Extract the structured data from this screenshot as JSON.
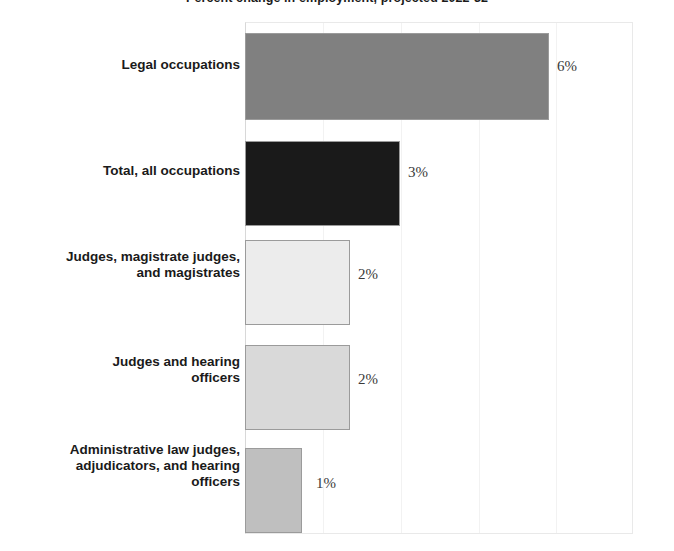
{
  "chart_data": {
    "type": "bar",
    "orientation": "horizontal",
    "title": "Percent change in employment, projected 2022-32",
    "categories": [
      "Legal occupations",
      "Total, all occupations",
      "Judges, magistrate judges,\nand magistrates",
      "Judges and hearing\nofficers",
      "Administrative law judges,\nadjudicators, and hearing\nofficers"
    ],
    "values": [
      6,
      3,
      2,
      2,
      1
    ],
    "value_labels": [
      "6%",
      "3%",
      "2%",
      "2%",
      "1%"
    ],
    "xlabel": "",
    "ylabel": "",
    "xlim": [
      0,
      7.65
    ],
    "grid": false,
    "legend": false,
    "bar_colors": [
      "#808080",
      "#1a1a1a",
      "#ececec",
      "#d9d9d9",
      "#bfbfbf"
    ],
    "bar_border_color": "#9b9b9b",
    "background_color": "#ffffff",
    "text_color": "#1a1a1a",
    "value_text_color": "#3a3a3a"
  },
  "bars": [
    {
      "label": "Legal occupations",
      "value_label": "6%",
      "color": "#808080",
      "width_px": 304,
      "top_px": 33,
      "height_px": 87,
      "value_x_px": 557,
      "value_y_px": 66,
      "label_y_px": 65
    },
    {
      "label": "Total, all occupations",
      "value_label": "3%",
      "color": "#1a1a1a",
      "width_px": 155,
      "top_px": 141,
      "height_px": 85,
      "value_x_px": 408,
      "value_y_px": 172,
      "label_y_px": 171
    },
    {
      "label": "Judges, magistrate judges,\nand magistrates",
      "value_label": "2%",
      "color": "#ececec",
      "width_px": 105,
      "top_px": 240,
      "height_px": 85,
      "value_x_px": 358,
      "value_y_px": 274,
      "label_y_px": 265
    },
    {
      "label": "Judges and hearing\nofficers",
      "value_label": "2%",
      "color": "#d9d9d9",
      "width_px": 105,
      "top_px": 345,
      "height_px": 85,
      "value_x_px": 358,
      "value_y_px": 379,
      "label_y_px": 370
    },
    {
      "label": "Administrative law judges,\nadjudicators, and hearing\nofficers",
      "value_label": "1%",
      "color": "#bfbfbf",
      "width_px": 57,
      "top_px": 448,
      "height_px": 85,
      "value_x_px": 316,
      "value_y_px": 483,
      "label_y_px": 466
    }
  ]
}
